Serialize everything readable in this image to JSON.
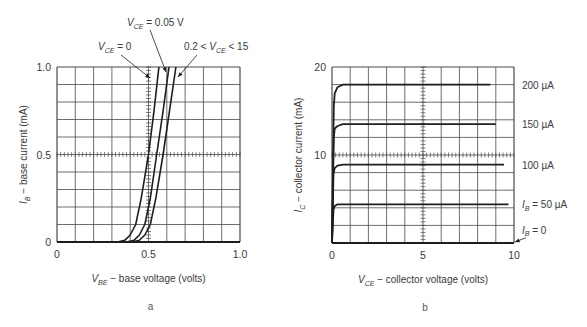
{
  "chart_data": [
    {
      "id": "a",
      "type": "line",
      "panel_label": "a",
      "title": "",
      "xlabel": "V_BE − base voltage (volts)",
      "xlabel_parts": {
        "var": "V",
        "sub": "BE",
        "rest": " − base voltage (volts)"
      },
      "ylabel": "I_B − base current (mA)",
      "ylabel_parts": {
        "var": "I",
        "sub": "B",
        "rest": " − base current (mA)"
      },
      "xlim": [
        0,
        1.0
      ],
      "ylim": [
        0,
        1.0
      ],
      "x_ticks": [
        "0",
        "0.5",
        "1.0"
      ],
      "y_ticks": [
        "0",
        "0.5",
        "1.0"
      ],
      "grid": true,
      "grid_divisions": {
        "x": 10,
        "y": 10
      },
      "series": [
        {
          "name": "V_CE = 0",
          "x": [
            0.0,
            0.33,
            0.37,
            0.4,
            0.43,
            0.46,
            0.5,
            0.53,
            0.557
          ],
          "y": [
            0.0,
            0.0,
            0.01,
            0.04,
            0.1,
            0.25,
            0.5,
            0.75,
            1.0
          ]
        },
        {
          "name": "V_CE = 0.05 V",
          "x": [
            0.0,
            0.38,
            0.42,
            0.45,
            0.48,
            0.51,
            0.545,
            0.58,
            0.612
          ],
          "y": [
            0.0,
            0.0,
            0.01,
            0.04,
            0.1,
            0.25,
            0.5,
            0.75,
            1.0
          ]
        },
        {
          "name": "0.2 < V_CE < 15",
          "x": [
            0.0,
            0.41,
            0.45,
            0.48,
            0.51,
            0.54,
            0.58,
            0.615,
            0.65
          ],
          "y": [
            0.0,
            0.0,
            0.01,
            0.04,
            0.1,
            0.25,
            0.5,
            0.75,
            1.0
          ]
        }
      ],
      "annotations": [
        {
          "text": "V_CE = 0.05 V",
          "var": "V",
          "sub": "CE",
          "rest": " = 0.05 V",
          "x": 127,
          "y": 26,
          "arrow": [
            150,
            30,
            166,
            72
          ]
        },
        {
          "text": "V_CE = 0",
          "var": "V",
          "sub": "CE",
          "rest": " = 0",
          "x": 98,
          "y": 50,
          "arrow": [
            121,
            55,
            150,
            78
          ]
        },
        {
          "text": "0.2 < V_CE < 15",
          "pre": "0.2 < ",
          "var": "V",
          "sub": "CE",
          "rest": " < 15",
          "x": 184,
          "y": 50,
          "arrow": [
            197,
            55,
            178,
            77
          ]
        }
      ]
    },
    {
      "id": "b",
      "type": "line",
      "panel_label": "b",
      "title": "",
      "xlabel": "V_CE − collector voltage (volts)",
      "xlabel_parts": {
        "var": "V",
        "sub": "CE",
        "rest": " − collector voltage (volts)"
      },
      "ylabel": "I_C − collector current (mA)",
      "ylabel_parts": {
        "var": "I",
        "sub": "C",
        "rest": " − collector current (mA)"
      },
      "xlim": [
        0,
        10
      ],
      "ylim": [
        0,
        20
      ],
      "x_ticks": [
        "0",
        "5",
        "10"
      ],
      "y_ticks": [
        "",
        "10",
        "20"
      ],
      "grid": true,
      "grid_divisions": {
        "x": 10,
        "y": 10
      },
      "series": [
        {
          "name": "200 µA",
          "label": "200 µA",
          "x": [
            0.0,
            0.1,
            0.15,
            0.3,
            0.6,
            8.7
          ],
          "y": [
            0.0,
            15.5,
            17.0,
            17.7,
            18.0,
            18.0
          ]
        },
        {
          "name": "150 µA",
          "label": "150 µA",
          "x": [
            0.0,
            0.1,
            0.15,
            0.3,
            0.6,
            9.0
          ],
          "y": [
            0.0,
            12.0,
            13.0,
            13.3,
            13.5,
            13.5
          ]
        },
        {
          "name": "100 µA",
          "label": "100 µA",
          "x": [
            0.0,
            0.08,
            0.15,
            0.3,
            0.6,
            9.45
          ],
          "y": [
            0.0,
            7.9,
            8.5,
            8.8,
            8.9,
            8.9
          ]
        },
        {
          "name": "I_B = 50 µA",
          "label": "I_B = 50 µA",
          "x": [
            0.0,
            0.08,
            0.15,
            0.3,
            0.6,
            9.7
          ],
          "y": [
            0.0,
            3.8,
            4.2,
            4.4,
            4.4,
            4.4
          ]
        },
        {
          "name": "I_B = 0",
          "label": "I_B = 0",
          "x": [
            0.0,
            10.0
          ],
          "y": [
            0.0,
            0.0
          ]
        }
      ],
      "curve_labels": [
        {
          "text": "200 µA",
          "y_val": 18.0
        },
        {
          "text": "150 µA",
          "y_val": 13.5
        },
        {
          "text": "100 µA",
          "y_val": 8.9
        },
        {
          "text": "I_B = 50 µA",
          "var": "I",
          "sub": "B",
          "rest": " = 50 µA",
          "y_val": 4.4
        },
        {
          "text": "I_B = 0",
          "var": "I",
          "sub": "B",
          "rest": " = 0",
          "y_val": 1.5
        }
      ]
    }
  ],
  "layout": {
    "a": {
      "x0": 57,
      "x1": 240,
      "y0": 242,
      "y1": 67
    },
    "b": {
      "x0": 332,
      "x1": 514,
      "y0": 243,
      "y1": 67
    }
  },
  "colors": {
    "curve": "#1e1e1e",
    "grid": "#4a4a4a",
    "text": "#3a3a3a"
  }
}
